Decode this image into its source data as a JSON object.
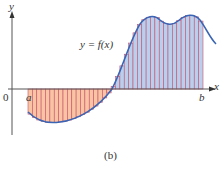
{
  "figure": {
    "caption": "(b)",
    "curve_label": "y = f(x)",
    "axis_labels": {
      "x": "x",
      "y": "y",
      "origin": "0"
    },
    "interval": {
      "a": "a",
      "b": "b"
    },
    "colors": {
      "curve": "#3a64b4",
      "positive_fill": "#b9cfee",
      "negative_fill": "#f8c4a4",
      "rect_lines": "#c8506a",
      "axis": "#555555"
    }
  },
  "chart_data": {
    "type": "area",
    "title": "",
    "xlabel": "x",
    "ylabel": "y",
    "annotations": [
      "y = f(x)",
      "0",
      "a",
      "b",
      "(b)"
    ],
    "regions": [
      {
        "name": "negative area",
        "from": "a",
        "to": "zero crossing",
        "color": "#f8c4a4"
      },
      {
        "name": "positive area",
        "from": "zero crossing",
        "to": "b",
        "color": "#b9cfee"
      }
    ],
    "grid": false,
    "legend": "none"
  }
}
